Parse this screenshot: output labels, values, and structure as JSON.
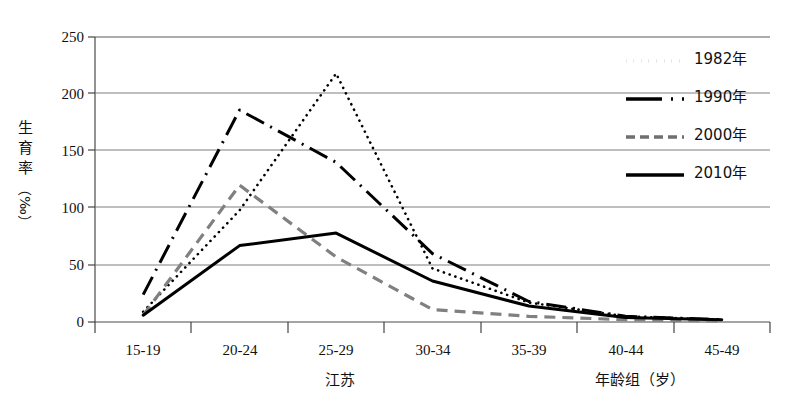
{
  "chart_data": {
    "type": "line",
    "title": "",
    "xlabel": "年龄组（岁）",
    "ylabel": "生育率（‰）",
    "region_caption": "江苏",
    "categories": [
      "15-19",
      "20-24",
      "25-29",
      "30-34",
      "35-39",
      "40-44",
      "45-49"
    ],
    "ylim": [
      0,
      250
    ],
    "yticks": [
      0,
      50,
      100,
      150,
      200,
      250
    ],
    "grid": true,
    "legend_position": "top-right",
    "series": [
      {
        "name": "1982年",
        "style": "dotted",
        "color": "#000000",
        "values": [
          9,
          98,
          218,
          47,
          17,
          5,
          2
        ]
      },
      {
        "name": "1990年",
        "style": "dash-dot",
        "color": "#000000",
        "values": [
          24,
          186,
          140,
          60,
          18,
          5,
          2
        ]
      },
      {
        "name": "2000年",
        "style": "dashed",
        "color": "#808080",
        "values": [
          6,
          120,
          57,
          11,
          5,
          2,
          1
        ]
      },
      {
        "name": "2010年",
        "style": "solid",
        "color": "#000000",
        "values": [
          6,
          67,
          78,
          36,
          14,
          4,
          2
        ]
      }
    ]
  },
  "yaxis": {
    "title_chars": [
      "生",
      "育",
      "率"
    ],
    "unit": "（‰）",
    "ticks": [
      "250",
      "200",
      "150",
      "100",
      "50",
      "0"
    ]
  },
  "xaxis": {
    "ticks": [
      "15-19",
      "20-24",
      "25-29",
      "30-34",
      "35-39",
      "40-44",
      "45-49"
    ],
    "title": "年龄组（岁）",
    "region_caption": "江苏"
  },
  "legend": {
    "items": [
      {
        "label": "1982年",
        "style": "dotted"
      },
      {
        "label": "1990年",
        "style": "dash-dot"
      },
      {
        "label": "2000年",
        "style": "dashed"
      },
      {
        "label": "2010年",
        "style": "solid"
      }
    ]
  }
}
